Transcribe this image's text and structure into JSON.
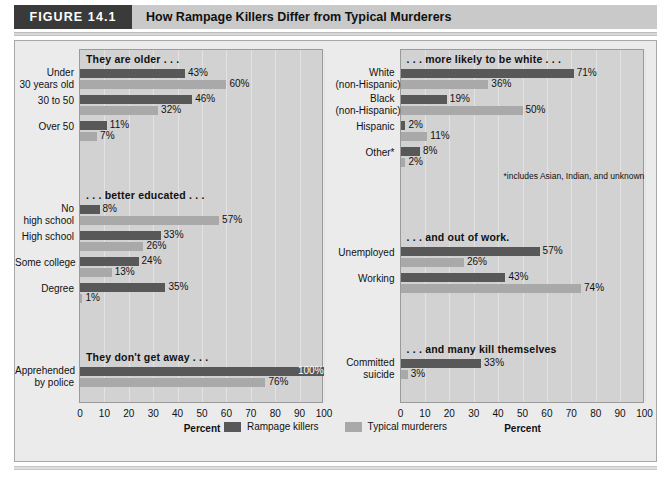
{
  "header": {
    "badge": "FIGURE 14.1",
    "title": "How Rampage Killers Differ from Typical Murderers"
  },
  "legend": {
    "items": [
      {
        "label": "Rampage killers",
        "color": "#585858",
        "key": "rampage"
      },
      {
        "label": "Typical murderers",
        "color": "#a9a9a9",
        "key": "typical"
      }
    ]
  },
  "axis": {
    "title": "Percent",
    "ticks": [
      "0",
      "10",
      "20",
      "30",
      "40",
      "50",
      "60",
      "70",
      "80",
      "90",
      "100"
    ],
    "min": 0,
    "max": 100
  },
  "footnote": "*includes Asian, Indian, and unknown",
  "chart_data": {
    "type": "bar",
    "title": "How Rampage Killers Differ from Typical Murderers",
    "xlabel": "Percent",
    "ylabel": "",
    "xlim": [
      0,
      100
    ],
    "orientation": "horizontal",
    "grid": true,
    "legend_position": "bottom-center",
    "series": [
      {
        "name": "Rampage killers",
        "color": "#585858"
      },
      {
        "name": "Typical murderers",
        "color": "#a9a9a9"
      }
    ],
    "panels": [
      {
        "panel": "left",
        "sections": [
          {
            "title": "They are older . . .",
            "categories": [
              "Under\n30 years old",
              "30 to 50",
              "Over 50"
            ],
            "rows": [
              {
                "label_lines": [
                  "Under",
                  "30 years old"
                ],
                "rampage": 43,
                "typical": 60,
                "rampage_label": "43%",
                "typical_label": "60%"
              },
              {
                "label_lines": [
                  "30 to 50"
                ],
                "rampage": 46,
                "typical": 32,
                "rampage_label": "46%",
                "typical_label": "32%"
              },
              {
                "label_lines": [
                  "Over 50"
                ],
                "rampage": 11,
                "typical": 7,
                "rampage_label": "11%",
                "typical_label": "7%"
              }
            ]
          },
          {
            "title": ". . . better educated . . .",
            "rows": [
              {
                "label_lines": [
                  "No",
                  "high school"
                ],
                "rampage": 8,
                "typical": 57,
                "rampage_label": "8%",
                "typical_label": "57%"
              },
              {
                "label_lines": [
                  "High school"
                ],
                "rampage": 33,
                "typical": 26,
                "rampage_label": "33%",
                "typical_label": "26%"
              },
              {
                "label_lines": [
                  "Some college"
                ],
                "rampage": 24,
                "typical": 13,
                "rampage_label": "24%",
                "typical_label": "13%"
              },
              {
                "label_lines": [
                  "Degree"
                ],
                "rampage": 35,
                "typical": 1,
                "rampage_label": "35%",
                "typical_label": "1%"
              }
            ]
          },
          {
            "title": "They don't get away . . .",
            "rows": [
              {
                "label_lines": [
                  "Apprehended",
                  "by police"
                ],
                "rampage": 100,
                "typical": 76,
                "rampage_label": "100%",
                "typical_label": "76%",
                "rampage_label_inside": true
              }
            ]
          }
        ]
      },
      {
        "panel": "right",
        "sections": [
          {
            "title": ". . . more likely to be white . . .",
            "rows": [
              {
                "label_lines": [
                  "White",
                  "(non-Hispanic)"
                ],
                "rampage": 71,
                "typical": 36,
                "rampage_label": "71%",
                "typical_label": "36%"
              },
              {
                "label_lines": [
                  "Black",
                  "(non-Hispanic)"
                ],
                "rampage": 19,
                "typical": 50,
                "rampage_label": "19%",
                "typical_label": "50%"
              },
              {
                "label_lines": [
                  "Hispanic"
                ],
                "rampage": 2,
                "typical": 11,
                "rampage_label": "2%",
                "typical_label": "11%"
              },
              {
                "label_lines": [
                  "Other*"
                ],
                "rampage": 8,
                "typical": 2,
                "rampage_label": "8%",
                "typical_label": "2%"
              }
            ]
          },
          {
            "title": ". . . and out of work.",
            "rows": [
              {
                "label_lines": [
                  "Unemployed"
                ],
                "rampage": 57,
                "typical": 26,
                "rampage_label": "57%",
                "typical_label": "26%"
              },
              {
                "label_lines": [
                  "Working"
                ],
                "rampage": 43,
                "typical": 74,
                "rampage_label": "43%",
                "typical_label": "74%"
              }
            ]
          },
          {
            "title": ". . . and many kill themselves",
            "rows": [
              {
                "label_lines": [
                  "Committed",
                  "suicide"
                ],
                "rampage": 33,
                "typical": 3,
                "rampage_label": "33%",
                "typical_label": "3%"
              }
            ]
          }
        ]
      }
    ]
  }
}
